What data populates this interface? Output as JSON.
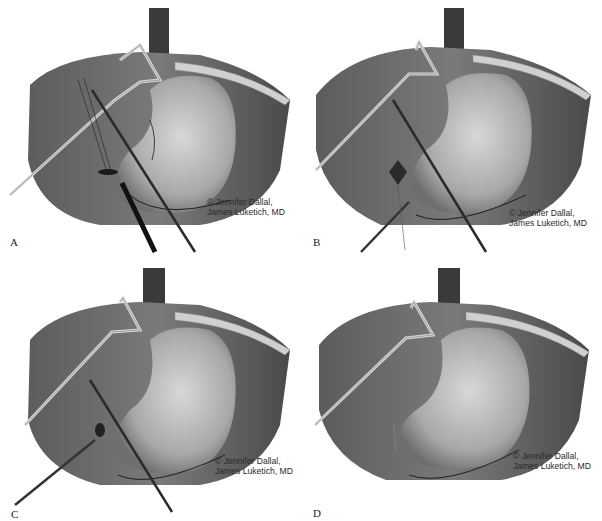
{
  "figure": {
    "panels": [
      {
        "id": "A",
        "label": "A",
        "credit_line1": "© Jennifer Dallal,",
        "credit_line2": "James Luketich, MD",
        "instruments": [
          "liver-retractor",
          "grasper",
          "needle-driver",
          "suture-device"
        ]
      },
      {
        "id": "B",
        "label": "B",
        "credit_line1": "© Jennifer Dallal,",
        "credit_line2": "James Luketich, MD",
        "instruments": [
          "liver-retractor",
          "grasper",
          "needle-driver"
        ]
      },
      {
        "id": "C",
        "label": "C",
        "credit_line1": "© Jennifer Dallal,",
        "credit_line2": "James Luketich, MD",
        "instruments": [
          "liver-retractor",
          "grasper",
          "needle-driver"
        ]
      },
      {
        "id": "D",
        "label": "D",
        "credit_line1": "© Jennifer Dallal,",
        "credit_line2": "James Luketich, MD",
        "instruments": [
          "liver-retractor"
        ]
      }
    ]
  },
  "colors": {
    "background": "#ffffff",
    "tissue_dark": "#5a5a5a",
    "tissue_mid": "#9a9a9a",
    "stomach_light": "#c8c8c8",
    "instrument": "#2a2a2a",
    "retractor": "#e0e0e0",
    "vessel": "#1e1e1e"
  }
}
